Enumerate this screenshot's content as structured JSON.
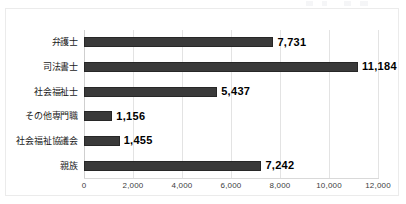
{
  "chart_data": {
    "type": "bar",
    "orientation": "horizontal",
    "title": "",
    "subtitle": "",
    "xlabel": "",
    "ylabel": "",
    "categories": [
      "弁護士",
      "司法書士",
      "社会福祉士",
      "その他専門職",
      "社会福祉協議会",
      "親族"
    ],
    "values": [
      7731,
      5437,
      1156,
      1455,
      7242,
      11184
    ],
    "series": [
      {
        "name": "件数",
        "values": [
          7731,
          11184,
          5437,
          1156,
          1455,
          7242
        ]
      }
    ],
    "data_labels": [
      "7,731",
      "11,184",
      "5,437",
      "1,156",
      "1,455",
      "7,242"
    ],
    "xlim": [
      0,
      12000
    ],
    "xticks": [
      0,
      2000,
      4000,
      6000,
      8000,
      10000,
      12000
    ],
    "xtick_labels": [
      "0",
      "2,000",
      "4,000",
      "6,000",
      "8,000",
      "10,000",
      "12,000"
    ],
    "grid": true,
    "grid_axis": "x",
    "legend": false,
    "legend_position": "none",
    "bar_color": "#3a3a3a",
    "grid_color": "#e3e3e3",
    "axis_color": "#d9d9d9",
    "background_color": "#ffffff",
    "rows": [
      {
        "label": "弁護士",
        "value": 7731,
        "label_text": "7,731"
      },
      {
        "label": "司法書士",
        "value": 11184,
        "label_text": "11,184"
      },
      {
        "label": "社会福祉士",
        "value": 5437,
        "label_text": "5,437"
      },
      {
        "label": "その他専門職",
        "value": 1156,
        "label_text": "1,156"
      },
      {
        "label": "社会福祉協議会",
        "value": 1455,
        "label_text": "1,455"
      },
      {
        "label": "親族",
        "value": 7242,
        "label_text": "7,242"
      }
    ]
  }
}
